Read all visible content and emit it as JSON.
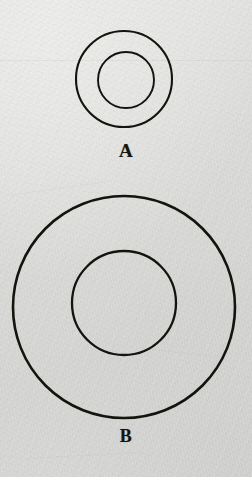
{
  "image": {
    "kind": "scanned-paper-diagram",
    "background_color": "#dcdcda",
    "ink_color": "#15150f",
    "width": 252,
    "height": 477
  },
  "figures": [
    {
      "id": "figure-a",
      "label": "A",
      "shape": "concentric-circles",
      "center": {
        "x": 124,
        "y": 79
      },
      "outer_diameter": 96,
      "inner_diameter": 56,
      "outer_stroke_width": 2.1,
      "inner_stroke_width": 1.9,
      "stroke_color": "#14140e"
    },
    {
      "id": "figure-b",
      "label": "B",
      "shape": "concentric-circles",
      "center": {
        "x": 124,
        "y": 307
      },
      "outer_diameter": 222,
      "inner_diameter": 104,
      "outer_stroke_width": 2.6,
      "inner_stroke_width": 2.3,
      "stroke_color": "#14140e"
    }
  ]
}
